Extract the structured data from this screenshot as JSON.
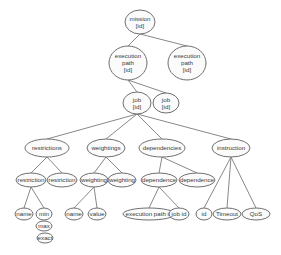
{
  "diagram": {
    "type": "tree",
    "nodes": [
      {
        "id": "mission",
        "lines": [
          "mission",
          "[id]"
        ],
        "cx": 140,
        "cy": 22,
        "rx": 15,
        "ry": 12
      },
      {
        "id": "exec_path_1",
        "lines": [
          "execution",
          "path",
          "[id]"
        ],
        "cx": 128,
        "cy": 63,
        "rx": 19,
        "ry": 17
      },
      {
        "id": "exec_path_2",
        "lines": [
          "execution",
          "path",
          "[id]"
        ],
        "cx": 187,
        "cy": 63,
        "rx": 19,
        "ry": 17
      },
      {
        "id": "job_1",
        "lines": [
          "job",
          "[id]"
        ],
        "cx": 137,
        "cy": 103,
        "rx": 14,
        "ry": 11
      },
      {
        "id": "job_2",
        "lines": [
          "job",
          "[id]"
        ],
        "cx": 166,
        "cy": 103,
        "rx": 13,
        "ry": 10
      },
      {
        "id": "restrictions",
        "lines": [
          "restrictions"
        ],
        "cx": 47,
        "cy": 148,
        "rx": 22,
        "ry": 9
      },
      {
        "id": "weightings",
        "lines": [
          "weightings"
        ],
        "cx": 106,
        "cy": 148,
        "rx": 19,
        "ry": 9
      },
      {
        "id": "dependencies",
        "lines": [
          "dependencies"
        ],
        "cx": 162,
        "cy": 148,
        "rx": 23,
        "ry": 9
      },
      {
        "id": "instruction",
        "lines": [
          "instruction"
        ],
        "cx": 231,
        "cy": 148,
        "rx": 19,
        "ry": 9
      },
      {
        "id": "restriction_1",
        "lines": [
          "restriction"
        ],
        "cx": 31,
        "cy": 180,
        "rx": 15,
        "ry": 7
      },
      {
        "id": "restriction_2",
        "lines": [
          "restriction"
        ],
        "cx": 62,
        "cy": 180,
        "rx": 15,
        "ry": 7
      },
      {
        "id": "weighting_1",
        "lines": [
          "weighting"
        ],
        "cx": 94,
        "cy": 180,
        "rx": 14,
        "ry": 7
      },
      {
        "id": "weighting_2",
        "lines": [
          "weighting"
        ],
        "cx": 122,
        "cy": 180,
        "rx": 14,
        "ry": 7
      },
      {
        "id": "dependence_1",
        "lines": [
          "dependence"
        ],
        "cx": 159,
        "cy": 180,
        "rx": 18,
        "ry": 7
      },
      {
        "id": "dependence_2",
        "lines": [
          "dependence"
        ],
        "cx": 197,
        "cy": 180,
        "rx": 18,
        "ry": 7
      },
      {
        "id": "name_1",
        "lines": [
          "name"
        ],
        "cx": 24,
        "cy": 214,
        "rx": 9,
        "ry": 6
      },
      {
        "id": "min",
        "lines": [
          "min"
        ],
        "cx": 44,
        "cy": 214,
        "rx": 8,
        "ry": 6
      },
      {
        "id": "max",
        "lines": [
          "max"
        ],
        "cx": 44,
        "cy": 226,
        "rx": 8,
        "ry": 5
      },
      {
        "id": "exact",
        "lines": [
          "exact"
        ],
        "cx": 45,
        "cy": 238,
        "rx": 8,
        "ry": 5
      },
      {
        "id": "name_2",
        "lines": [
          "name"
        ],
        "cx": 74,
        "cy": 214,
        "rx": 9,
        "ry": 6
      },
      {
        "id": "value",
        "lines": [
          "value"
        ],
        "cx": 97,
        "cy": 214,
        "rx": 9,
        "ry": 6
      },
      {
        "id": "execution_path_id",
        "lines": [
          "execution path id"
        ],
        "cx": 149,
        "cy": 214,
        "rx": 26,
        "ry": 6
      },
      {
        "id": "job_id",
        "lines": [
          "job id"
        ],
        "cx": 179,
        "cy": 214,
        "rx": 10,
        "ry": 6
      },
      {
        "id": "id",
        "lines": [
          "id"
        ],
        "cx": 204,
        "cy": 214,
        "rx": 8,
        "ry": 6
      },
      {
        "id": "timeout",
        "lines": [
          "Timeout"
        ],
        "cx": 227,
        "cy": 214,
        "rx": 14,
        "ry": 6
      },
      {
        "id": "qos",
        "lines": [
          "QoS"
        ],
        "cx": 256,
        "cy": 214,
        "rx": 14,
        "ry": 6
      }
    ],
    "edges": [
      [
        "mission",
        "exec_path_1"
      ],
      [
        "mission",
        "exec_path_2"
      ],
      [
        "exec_path_1",
        "job_1"
      ],
      [
        "exec_path_1",
        "job_2"
      ],
      [
        "job_1",
        "restrictions"
      ],
      [
        "job_1",
        "weightings"
      ],
      [
        "job_1",
        "dependencies"
      ],
      [
        "job_1",
        "instruction"
      ],
      [
        "restrictions",
        "restriction_1"
      ],
      [
        "restrictions",
        "restriction_2"
      ],
      [
        "weightings",
        "weighting_1"
      ],
      [
        "weightings",
        "weighting_2"
      ],
      [
        "dependencies",
        "dependence_1"
      ],
      [
        "dependencies",
        "dependence_2"
      ],
      [
        "restriction_1",
        "name_1"
      ],
      [
        "restriction_1",
        "min"
      ],
      [
        "weighting_1",
        "name_2"
      ],
      [
        "weighting_1",
        "value"
      ],
      [
        "dependence_1",
        "execution_path_id"
      ],
      [
        "dependence_1",
        "job_id"
      ],
      [
        "instruction",
        "id"
      ],
      [
        "instruction",
        "timeout"
      ],
      [
        "instruction",
        "qos"
      ]
    ]
  }
}
